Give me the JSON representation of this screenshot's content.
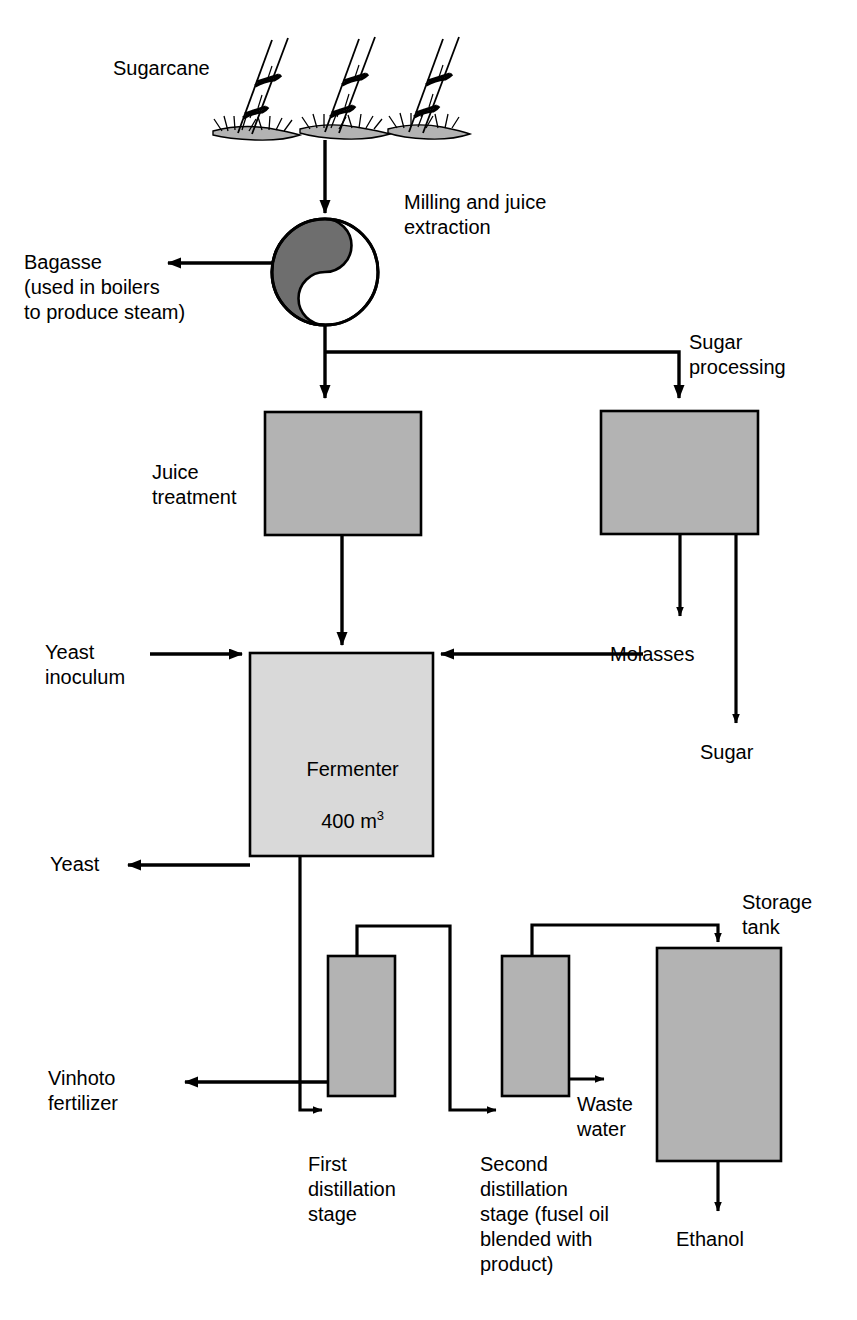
{
  "diagram": {
    "colors": {
      "line": "#000000",
      "box_fill": "#b3b3b3",
      "box_fill_light": "#d9d9d9",
      "box_stroke": "#000000",
      "mill_dark": "#6e6e6e",
      "mill_light": "#ffffff",
      "ground": "#b3b3b3",
      "background": "#ffffff"
    }
  },
  "labels": {
    "sugarcane": "Sugarcane",
    "milling": "Milling and juice\nextraction",
    "bagasse": "Bagasse\n(used in boilers\nto produce steam)",
    "sugar_processing": "Sugar\nprocessing",
    "juice_treatment": "Juice\ntreatment",
    "yeast_inoculum": "Yeast\ninoculum",
    "molasses": "Molasses",
    "sugar": "Sugar",
    "yeast": "Yeast",
    "vinhoto": "Vinhoto\nfertilizer",
    "storage_tank": "Storage\ntank",
    "waste_water": "Waste\nwater",
    "first_distillation": "First\ndistillation\nstage",
    "second_distillation": "Second\ndistillation\nstage (fusel oil\nblended with\nproduct)",
    "ethanol": "Ethanol"
  },
  "nodes": {
    "fermenter": {
      "name": "Fermenter",
      "volume": "400 m",
      "volume_exponent": "3"
    }
  },
  "flows": [
    {
      "from": "sugarcane",
      "to": "milling"
    },
    {
      "from": "milling",
      "to": "bagasse"
    },
    {
      "from": "milling",
      "to": "juice_treatment"
    },
    {
      "from": "milling",
      "to": "sugar_processing"
    },
    {
      "from": "juice_treatment",
      "to": "fermenter"
    },
    {
      "from": "sugar_processing",
      "to": "molasses"
    },
    {
      "from": "sugar_processing",
      "to": "sugar"
    },
    {
      "from": "molasses",
      "to": "fermenter"
    },
    {
      "from": "yeast_inoculum",
      "to": "fermenter"
    },
    {
      "from": "fermenter",
      "to": "yeast"
    },
    {
      "from": "fermenter",
      "to": "vinhoto"
    },
    {
      "from": "fermenter",
      "to": "first_distillation"
    },
    {
      "from": "first_distillation",
      "to": "second_distillation"
    },
    {
      "from": "second_distillation",
      "to": "waste_water"
    },
    {
      "from": "second_distillation",
      "to": "storage_tank"
    },
    {
      "from": "storage_tank",
      "to": "ethanol"
    }
  ]
}
